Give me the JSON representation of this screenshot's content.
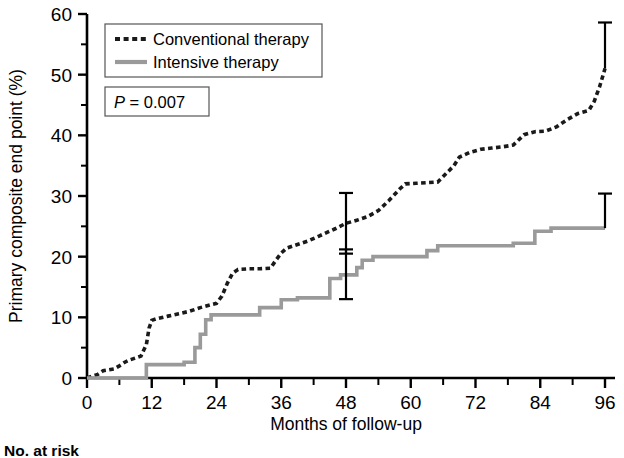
{
  "figure": {
    "background_color": "#ffffff",
    "axis_color": "#000000"
  },
  "chart_data": {
    "type": "line",
    "title": "",
    "subtitle": "",
    "xlabel": "Months of follow-up",
    "ylabel": "Primary composite end point (%)",
    "xlim": [
      0,
      96
    ],
    "ylim": [
      0,
      60
    ],
    "x_major_ticks": [
      0,
      12,
      24,
      36,
      48,
      60,
      72,
      84,
      96
    ],
    "x_major_tick_labels": [
      "0",
      "12",
      "24",
      "36",
      "48",
      "60",
      "72",
      "84",
      "96"
    ],
    "x_minor_ticks": [
      6,
      18,
      30,
      42,
      54,
      66,
      78,
      90
    ],
    "y_major_ticks": [
      0,
      10,
      20,
      30,
      40,
      50,
      60
    ],
    "y_major_tick_labels": [
      "0",
      "10",
      "20",
      "30",
      "40",
      "50",
      "60"
    ],
    "y_minor_ticks": [
      5,
      15,
      25,
      35,
      45,
      55
    ],
    "grid": false,
    "legend_position": "top-left",
    "annotations": [
      {
        "name": "p-value",
        "text": "P = 0.007",
        "italic_prefix": "P",
        "rest": " = 0.007"
      }
    ],
    "series": [
      {
        "name": "Conventional therapy",
        "style": "dotted",
        "color": "#1a1a1a",
        "linewidth": 3.6,
        "step": "post",
        "points": [
          [
            0,
            0.0
          ],
          [
            2,
            0.6
          ],
          [
            3,
            1.2
          ],
          [
            5,
            1.5
          ],
          [
            6,
            2.0
          ],
          [
            7,
            2.6
          ],
          [
            8,
            3.0
          ],
          [
            9,
            3.3
          ],
          [
            10,
            3.6
          ],
          [
            11,
            5.5
          ],
          [
            11.5,
            8.2
          ],
          [
            12,
            9.5
          ],
          [
            13,
            9.8
          ],
          [
            15,
            10.2
          ],
          [
            17,
            10.6
          ],
          [
            19,
            11.0
          ],
          [
            21,
            11.6
          ],
          [
            23,
            12.1
          ],
          [
            24,
            12.3
          ],
          [
            25,
            13.5
          ],
          [
            26,
            15.6
          ],
          [
            27,
            17.3
          ],
          [
            28,
            17.9
          ],
          [
            30,
            18.0
          ],
          [
            32,
            18.0
          ],
          [
            34,
            18.1
          ],
          [
            35,
            19.4
          ],
          [
            36,
            20.6
          ],
          [
            37,
            21.4
          ],
          [
            39,
            22.0
          ],
          [
            41,
            22.6
          ],
          [
            43,
            23.4
          ],
          [
            44,
            23.8
          ],
          [
            46,
            24.6
          ],
          [
            48,
            25.5
          ],
          [
            50,
            26.0
          ],
          [
            52,
            26.6
          ],
          [
            54,
            27.6
          ],
          [
            56,
            29.3
          ],
          [
            58,
            31.2
          ],
          [
            59,
            32.0
          ],
          [
            61,
            32.1
          ],
          [
            63,
            32.2
          ],
          [
            65,
            32.3
          ],
          [
            66,
            33.2
          ],
          [
            68,
            35.0
          ],
          [
            69,
            36.4
          ],
          [
            71,
            37.2
          ],
          [
            73,
            37.7
          ],
          [
            75,
            37.9
          ],
          [
            77,
            38.1
          ],
          [
            79,
            38.4
          ],
          [
            81,
            40.1
          ],
          [
            83,
            40.6
          ],
          [
            85,
            40.7
          ],
          [
            87,
            41.4
          ],
          [
            89,
            42.6
          ],
          [
            91,
            43.6
          ],
          [
            93,
            44.1
          ],
          [
            94,
            45.6
          ],
          [
            95,
            48.0
          ],
          [
            96,
            51.0
          ]
        ],
        "error_bars": [
          {
            "x": 48,
            "y": 25.5,
            "low": 20.5,
            "high": 30.5
          },
          {
            "x": 96,
            "y": 51.0,
            "low": 51.0,
            "high": 58.6
          }
        ]
      },
      {
        "name": "Intensive therapy",
        "style": "solid",
        "color": "#9a9a9a",
        "linewidth": 3.6,
        "step": "post",
        "points": [
          [
            0,
            0.0
          ],
          [
            11,
            0.0
          ],
          [
            11,
            2.2
          ],
          [
            18,
            2.2
          ],
          [
            18,
            2.6
          ],
          [
            20,
            2.6
          ],
          [
            20,
            5.0
          ],
          [
            21,
            5.0
          ],
          [
            21,
            7.2
          ],
          [
            22,
            7.2
          ],
          [
            22,
            9.6
          ],
          [
            23,
            9.6
          ],
          [
            23,
            10.4
          ],
          [
            32,
            10.4
          ],
          [
            32,
            11.6
          ],
          [
            36,
            11.6
          ],
          [
            36,
            12.9
          ],
          [
            39,
            12.9
          ],
          [
            39,
            13.2
          ],
          [
            45,
            13.2
          ],
          [
            45,
            16.4
          ],
          [
            47,
            16.4
          ],
          [
            47,
            17.0
          ],
          [
            50,
            17.0
          ],
          [
            50,
            18.2
          ],
          [
            51,
            18.2
          ],
          [
            51,
            19.4
          ],
          [
            53,
            19.4
          ],
          [
            53,
            20.0
          ],
          [
            63,
            20.0
          ],
          [
            63,
            21.0
          ],
          [
            65,
            21.0
          ],
          [
            65,
            21.8
          ],
          [
            79,
            21.8
          ],
          [
            79,
            22.2
          ],
          [
            83,
            22.2
          ],
          [
            83,
            24.2
          ],
          [
            86,
            24.2
          ],
          [
            86,
            24.7
          ],
          [
            96,
            24.7
          ]
        ],
        "error_bars": [
          {
            "x": 48,
            "y": 17.0,
            "low": 13.0,
            "high": 21.2
          },
          {
            "x": 96,
            "y": 24.7,
            "low": 24.7,
            "high": 30.4
          }
        ]
      }
    ]
  },
  "legend": {
    "entries": [
      {
        "label": "Conventional therapy",
        "style": "dotted",
        "color": "#1a1a1a"
      },
      {
        "label": "Intensive therapy",
        "style": "solid",
        "color": "#9a9a9a"
      }
    ]
  },
  "risk_table": {
    "title": "No. at risk"
  }
}
